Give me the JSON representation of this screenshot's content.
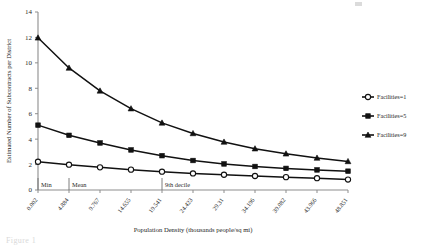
{
  "figure": {
    "caption_ghost": "Figure 1"
  },
  "chart_data": {
    "type": "line",
    "title": "",
    "xlabel": "Population Density (thousands people/sq mi)",
    "ylabel": "Estimated Number of Subcontracts per District",
    "categories": [
      "0.002",
      "4.884",
      "9.767",
      "14.655",
      "19.541",
      "24.423",
      "29.31",
      "34.196",
      "39.082",
      "43.966",
      "48.851"
    ],
    "xtick_labels": [
      "0.002",
      "4.884",
      "9.767",
      "14.655",
      "19.541",
      "24.423",
      "29.31",
      "34.196",
      "39.082",
      "43.966",
      "48.851"
    ],
    "ytick_labels": [
      "0",
      "2",
      "4",
      "6",
      "8",
      "10",
      "12",
      "14"
    ],
    "yticks": [
      0,
      2,
      4,
      6,
      8,
      10,
      12,
      14
    ],
    "ylim": [
      0,
      14
    ],
    "grid": false,
    "legend_position": "right",
    "series": [
      {
        "name": "Facilities=1",
        "marker": "open-circle",
        "values": [
          2.22,
          1.99,
          1.78,
          1.6,
          1.44,
          1.3,
          1.2,
          1.1,
          1.01,
          0.93,
          0.82
        ]
      },
      {
        "name": "Facilities=5",
        "marker": "filled-square",
        "values": [
          5.1,
          4.3,
          3.7,
          3.15,
          2.7,
          2.32,
          2.05,
          1.85,
          1.7,
          1.58,
          1.48
        ]
      },
      {
        "name": "Facilities=9",
        "marker": "filled-triangle",
        "values": [
          11.97,
          9.6,
          7.8,
          6.4,
          5.28,
          4.45,
          3.78,
          3.25,
          2.85,
          2.52,
          2.25
        ]
      }
    ],
    "annotations": [
      {
        "label": "Min",
        "category_index": 0
      },
      {
        "label": "Mean",
        "category_index": 1
      },
      {
        "label": "9th decile",
        "category_index": 4
      }
    ]
  },
  "legend": {
    "items": [
      {
        "label": "Facilities=1",
        "marker": "open-circle"
      },
      {
        "label": "Facilities=5",
        "marker": "filled-square"
      },
      {
        "label": "Facilities=9",
        "marker": "filled-triangle"
      }
    ]
  }
}
